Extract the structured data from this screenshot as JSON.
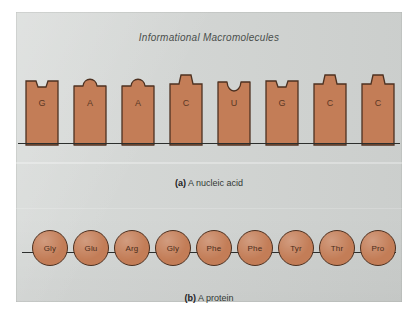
{
  "figure": {
    "title": "Informational Macromolecules",
    "background_color": "#d2d5d3",
    "molecule_color": "#c37d57",
    "outline_color": "#4d3121",
    "line_color": "#2c2f2d"
  },
  "panel_a": {
    "caption_label": "(a)",
    "caption_text": "A nucleic acid",
    "sequence": [
      {
        "base": "G",
        "top_shape": "square-notch"
      },
      {
        "base": "A",
        "top_shape": "round-bump"
      },
      {
        "base": "A",
        "top_shape": "round-bump"
      },
      {
        "base": "C",
        "top_shape": "t-tab"
      },
      {
        "base": "U",
        "top_shape": "round-notch"
      },
      {
        "base": "G",
        "top_shape": "square-notch"
      },
      {
        "base": "C",
        "top_shape": "t-tab"
      },
      {
        "base": "C",
        "top_shape": "t-tab"
      }
    ]
  },
  "panel_b": {
    "caption_label": "(b)",
    "caption_text": "A protein",
    "residues": [
      {
        "name": "Gly"
      },
      {
        "name": "Glu"
      },
      {
        "name": "Arg"
      },
      {
        "name": "Gly"
      },
      {
        "name": "Phe"
      },
      {
        "name": "Phe"
      },
      {
        "name": "Tyr"
      },
      {
        "name": "Thr"
      },
      {
        "name": "Pro"
      }
    ]
  }
}
